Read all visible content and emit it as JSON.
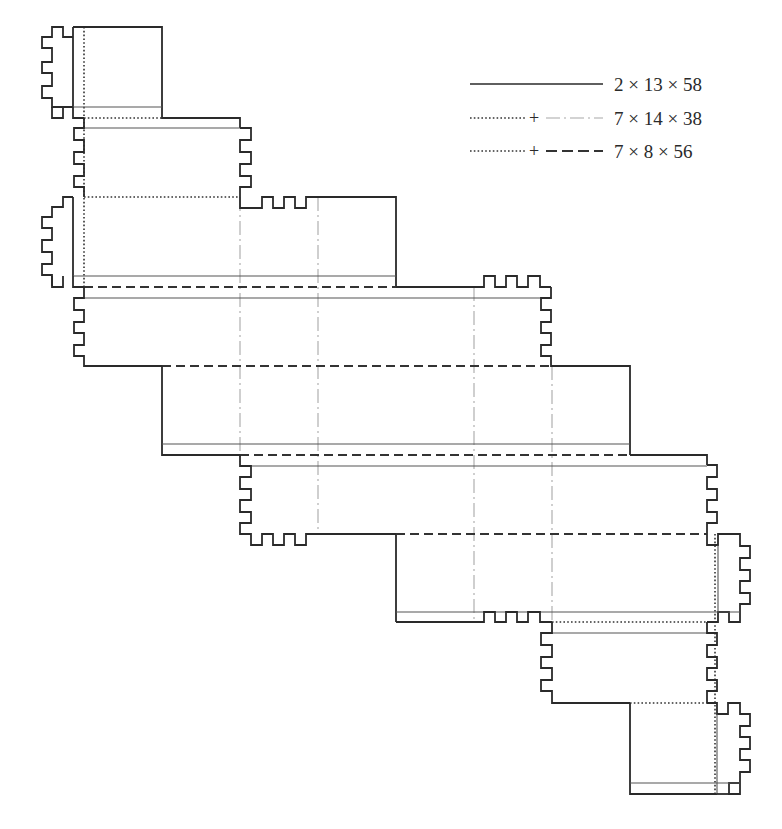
{
  "diagram": {
    "type": "box-net-cutting-pattern",
    "legend": {
      "items": [
        {
          "line_style": "solid",
          "label": "2 × 13 × 58"
        },
        {
          "line_style": "dotted + dash-dot",
          "plus": "+",
          "label": "7 × 14 × 38"
        },
        {
          "line_style": "dotted + dashed",
          "plus": "+",
          "label": "7 × 8 × 56"
        }
      ]
    },
    "colors": {
      "cut_line": "#2a2a2a",
      "fold_line_thin": "#555555",
      "dash_dot_line": "#a8a8a8",
      "background": "#ffffff"
    }
  }
}
